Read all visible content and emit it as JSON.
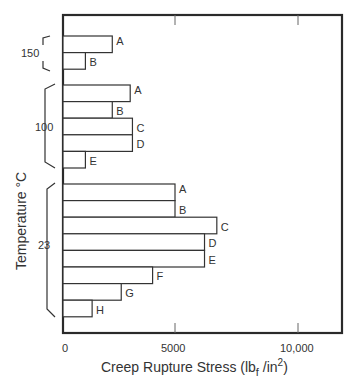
{
  "chart_data": {
    "type": "bar",
    "orientation": "horizontal",
    "title": "",
    "xlabel": "Creep Rupture Stress (lb_f/in^2)",
    "ylabel": "Temperature °C",
    "xlim": [
      0,
      12000
    ],
    "x_ticks": [
      0,
      5000,
      10000
    ],
    "x_tick_labels": [
      "0",
      "5000",
      "10,000"
    ],
    "grid": false,
    "legend": null,
    "groups": [
      {
        "temperature": "150",
        "bars": [
          {
            "label": "A",
            "value": 2200
          },
          {
            "label": "B",
            "value": 1000
          }
        ]
      },
      {
        "temperature": "100",
        "bars": [
          {
            "label": "A",
            "value": 3000
          },
          {
            "label": "B",
            "value": 2200
          },
          {
            "label": "C",
            "value": 3100
          },
          {
            "label": "D",
            "value": 3100
          },
          {
            "label": "E",
            "value": 1000
          }
        ]
      },
      {
        "temperature": "23",
        "bars": [
          {
            "label": "A",
            "value": 5000
          },
          {
            "label": "B",
            "value": 5000
          },
          {
            "label": "C",
            "value": 6700
          },
          {
            "label": "D",
            "value": 6200
          },
          {
            "label": "E",
            "value": 6200
          },
          {
            "label": "F",
            "value": 4000
          },
          {
            "label": "G",
            "value": 2600
          },
          {
            "label": "H",
            "value": 1300
          }
        ]
      }
    ]
  },
  "axis": {
    "x_title_main": "Creep Rupture Stress (lb",
    "x_title_sub": "f",
    "x_title_mid": " /in",
    "x_title_sup": "2",
    "x_title_end": ")",
    "y_title": "Temperature °C",
    "tick_0": "0",
    "tick_5000": "5000",
    "tick_10000": "10,000"
  },
  "groups": {
    "g150": "150",
    "g100": "100",
    "g23": "23"
  },
  "bar_labels": {
    "g150": [
      "A",
      "B"
    ],
    "g100": [
      "A",
      "B",
      "C",
      "D",
      "E"
    ],
    "g23": [
      "A",
      "B",
      "C",
      "D",
      "E",
      "F",
      "G",
      "H"
    ]
  }
}
